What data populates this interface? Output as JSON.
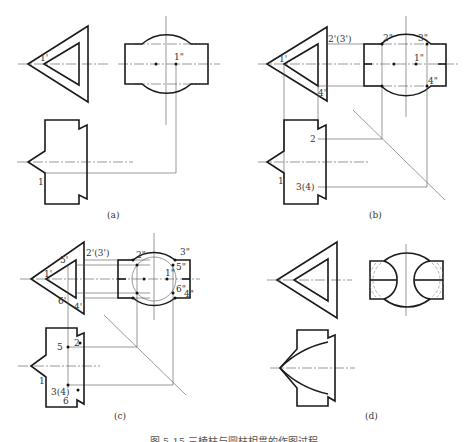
{
  "figure": {
    "caption": "图 5-15  三棱柱与圆柱相贯的作图过程",
    "panels": [
      {
        "id": "a",
        "label": "(a)",
        "labels": {
          "p1_front": "1'",
          "p1_side": "1\"",
          "p1_top": "1"
        }
      },
      {
        "id": "b",
        "label": "(b)",
        "labels": {
          "p1_front": "1'",
          "p23_front": "2'(3')",
          "p4_front": "4'",
          "p2_side": "2\"",
          "p3_side": "3\"",
          "p1_side": "1\"",
          "p4_side": "4\"",
          "p2_top": "2",
          "p1_top": "1",
          "p34_top": "3(4)"
        }
      },
      {
        "id": "c",
        "label": "(c)",
        "labels": {
          "p1_front": "1'",
          "p23_front": "2'(3')",
          "p5_front": "5'",
          "p6_front": "6'",
          "p4_front": "4'",
          "p2_side": "2\"",
          "p3_side": "3\"",
          "p1_side": "1\"",
          "p5_side": "5\"",
          "p6_side": "6\"",
          "p4_side": "4\"",
          "p5_top": "5",
          "p2_top": "2",
          "p1_top": "1",
          "p34_top": "3(4)",
          "p6_top": "6"
        }
      },
      {
        "id": "d",
        "label": "(d)",
        "labels": {}
      }
    ]
  }
}
